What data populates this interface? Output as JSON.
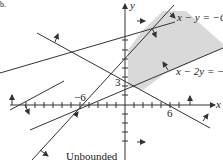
{
  "figure": {
    "panel_letter": "b.",
    "caption": "Unbounded",
    "region_fill": "#d9d9d9",
    "line_color": "#333333"
  },
  "axes": {
    "x_label": "x",
    "y_label": "y",
    "x_tick_labels": [
      {
        "value": -6,
        "text": "−6"
      },
      {
        "value": 6,
        "text": "6"
      }
    ],
    "y_tick_labels": [
      {
        "value": 3,
        "text": "3"
      }
    ]
  },
  "constraints": [
    {
      "id": "c1",
      "label": "x − y = −6"
    },
    {
      "id": "c2",
      "label": "x − 2y = −2"
    }
  ]
}
